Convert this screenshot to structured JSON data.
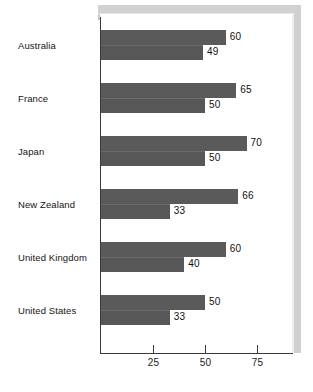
{
  "chart_data": {
    "type": "bar",
    "orientation": "horizontal",
    "title": "",
    "subtitle": "",
    "xlabel": "",
    "ylabel": "",
    "xlim": [
      0,
      93
    ],
    "grid": false,
    "legend": "none",
    "xticks": [
      25,
      50,
      75
    ],
    "xtick_labels": [
      "25",
      "50",
      "75"
    ],
    "categories": [
      "Australia",
      "France",
      "Japan",
      "New Zealand",
      "United Kingdom",
      "United States"
    ],
    "series": [
      {
        "name": "upper",
        "values": [
          60,
          65,
          70,
          66,
          60,
          50
        ]
      },
      {
        "name": "lower",
        "values": [
          49,
          50,
          50,
          33,
          40,
          33
        ]
      }
    ],
    "value_labels": {
      "upper": [
        "60",
        "65",
        "70",
        "66",
        "60",
        "50"
      ],
      "lower": [
        "49",
        "50",
        "50",
        "33",
        "40",
        "33"
      ]
    },
    "colors": {
      "bar": "#585858",
      "axis": "#3a3a3a",
      "text": "#111111",
      "background": "#ffffff",
      "frame": "#d2d2d2"
    }
  },
  "axis": {
    "x_origin_px": 101,
    "px_per_unit": 2.08,
    "tick_values": [
      25,
      50,
      75
    ]
  },
  "layout": {
    "group_top_start_px": 30,
    "group_pitch_px": 53,
    "bar_height_px": 15
  }
}
